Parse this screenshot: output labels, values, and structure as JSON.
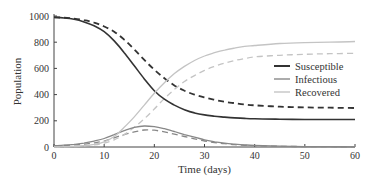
{
  "chart_data": {
    "type": "line",
    "title": "",
    "xlabel": "Time (days)",
    "ylabel": "Population",
    "xlim": [
      0,
      60
    ],
    "ylim": [
      0,
      1000
    ],
    "xticks": [
      0,
      10,
      20,
      30,
      40,
      50,
      60
    ],
    "yticks": [
      0,
      200,
      400,
      600,
      800,
      1000
    ],
    "grid": false,
    "legend_position": "center-right",
    "legend": [
      "Susceptible",
      "Infectious",
      "Recovered"
    ],
    "x": [
      0,
      2,
      4,
      6,
      8,
      10,
      12,
      14,
      16,
      18,
      20,
      22,
      24,
      26,
      28,
      30,
      32,
      34,
      36,
      38,
      40,
      45,
      50,
      55,
      60
    ],
    "series": [
      {
        "name": "Susceptible",
        "style": "solid",
        "color": "#333333",
        "values": [
          990,
          985,
          975,
          955,
          925,
          880,
          810,
          720,
          620,
          520,
          430,
          365,
          320,
          285,
          260,
          245,
          235,
          228,
          222,
          218,
          215,
          212,
          210,
          210,
          210
        ]
      },
      {
        "name": "Infectious",
        "style": "solid",
        "color": "#888888",
        "values": [
          10,
          14,
          20,
          30,
          45,
          65,
          95,
          125,
          150,
          160,
          155,
          140,
          118,
          95,
          75,
          55,
          40,
          30,
          22,
          16,
          12,
          6,
          3,
          2,
          1
        ]
      },
      {
        "name": "Recovered",
        "style": "solid",
        "color": "#c4c4c4",
        "values": [
          0,
          2,
          5,
          10,
          20,
          40,
          80,
          150,
          230,
          320,
          410,
          490,
          560,
          615,
          660,
          695,
          720,
          740,
          755,
          768,
          775,
          790,
          797,
          800,
          805
        ]
      },
      {
        "name": "Susceptible (dashed)",
        "style": "dashed",
        "color": "#333333",
        "values": [
          990,
          987,
          980,
          968,
          950,
          920,
          880,
          820,
          745,
          665,
          590,
          525,
          470,
          430,
          400,
          378,
          360,
          345,
          335,
          325,
          318,
          308,
          302,
          300,
          298
        ]
      },
      {
        "name": "Infectious (dashed)",
        "style": "dashed",
        "color": "#888888",
        "values": [
          10,
          12,
          16,
          22,
          32,
          45,
          70,
          95,
          115,
          130,
          128,
          115,
          98,
          80,
          62,
          46,
          34,
          25,
          18,
          13,
          10,
          5,
          3,
          2,
          1
        ]
      },
      {
        "name": "Recovered (dashed)",
        "style": "dashed",
        "color": "#c4c4c4",
        "values": [
          0,
          1,
          4,
          8,
          16,
          30,
          55,
          95,
          150,
          215,
          290,
          370,
          440,
          500,
          545,
          585,
          615,
          640,
          660,
          675,
          688,
          700,
          708,
          712,
          715
        ]
      }
    ]
  }
}
